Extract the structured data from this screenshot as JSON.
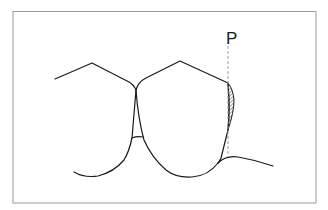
{
  "diagram": {
    "type": "dental-outline",
    "labels": {
      "point_label": "P"
    },
    "colors": {
      "stroke": "#1a1a1a",
      "frame": "#9a9a9a",
      "dashed": "#9a9a9a",
      "hatch": "#555555",
      "background": "#ffffff"
    }
  }
}
